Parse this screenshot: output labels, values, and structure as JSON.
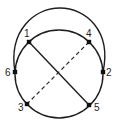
{
  "diagram": {
    "type": "graph-embedding",
    "circle": {
      "cx": 59,
      "cy": 74,
      "r": 44
    },
    "nodes": [
      {
        "id": "1",
        "label": "1",
        "x": 29,
        "y": 42,
        "lx": 24,
        "ly": 37
      },
      {
        "id": "4",
        "label": "4",
        "x": 89,
        "y": 42,
        "lx": 86,
        "ly": 37
      },
      {
        "id": "6",
        "label": "6",
        "x": 15,
        "y": 72,
        "lx": 5,
        "ly": 76
      },
      {
        "id": "2",
        "label": "2",
        "x": 103,
        "y": 72,
        "lx": 106,
        "ly": 76
      },
      {
        "id": "3",
        "label": "3",
        "x": 27,
        "y": 104,
        "lx": 18,
        "ly": 111
      },
      {
        "id": "5",
        "label": "5",
        "x": 89,
        "y": 105,
        "lx": 94,
        "ly": 111
      }
    ],
    "edges": [
      {
        "from": "1",
        "to": "5",
        "style": "solid",
        "kind": "chord"
      },
      {
        "from": "4",
        "to": "3",
        "style": "dashed",
        "kind": "chord"
      },
      {
        "from": "6",
        "to": "2",
        "style": "solid",
        "kind": "outer-arc"
      }
    ],
    "colors": {
      "stroke": "#1e1e1e",
      "node": "#111111",
      "background": "#ffffff"
    }
  }
}
